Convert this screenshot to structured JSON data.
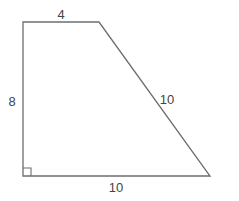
{
  "diagram": {
    "type": "right trapezoid",
    "stroke_color": "#6e6e6e",
    "label_color": "#444444",
    "vertices": {
      "top_left": [
        23,
        22
      ],
      "top_right": [
        99,
        22
      ],
      "bottom_right": [
        210,
        176
      ],
      "bottom_left": [
        23,
        176
      ]
    },
    "labels": {
      "top": "4",
      "left": "8",
      "slant": "10",
      "bottom": "10"
    },
    "right_angle_marker": "bottom-left"
  }
}
